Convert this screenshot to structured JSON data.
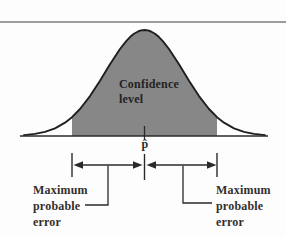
{
  "figure": {
    "curve_area_label": "Confidence\nlevel",
    "axis_center_label": "p̂",
    "left_annotation": "Maximum\nprobable\nerror",
    "right_annotation": "Maximum\nprobable\nerror",
    "colors": {
      "curve_fill": "#878787",
      "curve_outline": "#1f1f1f",
      "line": "#2a2a2a",
      "text": "#2b2b2b",
      "rule": "#9c9c9c"
    }
  }
}
